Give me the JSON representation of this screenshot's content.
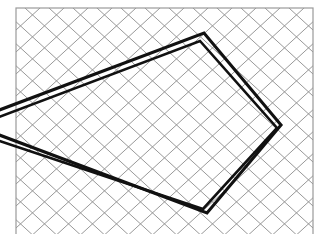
{
  "figure": {
    "alt_text": "Quadrilateral on rhombic grid paper"
  },
  "canvas": {
    "width": 322,
    "height": 234,
    "background_color": "#ffffff"
  },
  "frame": {
    "name": "grid-border-rectangle",
    "x": 16,
    "y": 8,
    "width": 297,
    "height": 232,
    "stroke_color": "#9a9a9a",
    "stroke_width": 1.2,
    "fill": "none"
  },
  "lattice": {
    "name": "rhombic-diamond-grid",
    "type": "rhombus",
    "cell_width": 24,
    "cell_height": 22,
    "stroke_color": "#8c8c8c",
    "stroke_width": 0.9,
    "origin_x": 16,
    "origin_y": 8,
    "direction_a_label": "down-right",
    "direction_b_label": "down-left",
    "columns": 14,
    "rows": 12
  },
  "shapes": [
    {
      "name": "quadrilateral-primary",
      "stroke_color": "#111111",
      "stroke_width": 3.1,
      "fill": "none",
      "closed": false,
      "vertices": [
        {
          "label": "left-edge-upper",
          "x": -6,
          "y": 112
        },
        {
          "label": "top-apex",
          "x": 204,
          "y": 33
        },
        {
          "label": "right-apex",
          "x": 281,
          "y": 125
        },
        {
          "label": "bottom-apex",
          "x": 207,
          "y": 213
        },
        {
          "label": "left-edge-lower",
          "x": -6,
          "y": 133
        }
      ]
    },
    {
      "name": "quadrilateral-offset",
      "stroke_color": "#111111",
      "stroke_width": 2.6,
      "fill": "none",
      "closed": false,
      "vertices": [
        {
          "label": "left-edge-upper-offset",
          "x": -6,
          "y": 119
        },
        {
          "label": "top-apex-offset",
          "x": 200,
          "y": 41
        },
        {
          "label": "right-apex-offset",
          "x": 277,
          "y": 128
        },
        {
          "label": "bottom-apex-offset",
          "x": 203,
          "y": 209
        },
        {
          "label": "left-edge-lower-offset",
          "x": -6,
          "y": 139
        }
      ]
    }
  ],
  "chart_data": {
    "type": "scatter",
    "xlabel": "",
    "ylabel": "",
    "xlim": [
      0,
      322
    ],
    "ylim": [
      234,
      0
    ],
    "grid": true,
    "legend_position": "none",
    "annotations": [
      "top apex near (204, 33)",
      "right apex near (281, 125)",
      "bottom apex near (207, 213)",
      "two left-hand edges run off the left border of the frame"
    ],
    "series": [
      {
        "name": "quadrilateral-primary",
        "x": [
          -6,
          204,
          281,
          207,
          -6
        ],
        "y": [
          112,
          33,
          125,
          213,
          133
        ]
      },
      {
        "name": "quadrilateral-offset",
        "x": [
          -6,
          200,
          277,
          203,
          -6
        ],
        "y": [
          119,
          41,
          128,
          209,
          139
        ]
      }
    ]
  }
}
